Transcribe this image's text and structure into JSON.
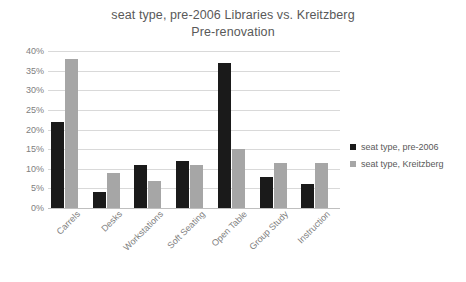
{
  "chart_data": {
    "type": "bar",
    "title": "seat type, pre-2006 Libraries vs. Kreitzberg Pre-renovation",
    "title_lines": [
      "seat type, pre-2006 Libraries vs. Kreitzberg",
      "Pre-renovation"
    ],
    "xlabel": "",
    "ylabel": "",
    "ylim": [
      0,
      40
    ],
    "ytick_step": 5,
    "ytick_labels": [
      "0%",
      "5%",
      "10%",
      "15%",
      "20%",
      "25%",
      "30%",
      "35%",
      "40%"
    ],
    "ytick_values": [
      0,
      5,
      10,
      15,
      20,
      25,
      30,
      35,
      40
    ],
    "grid": true,
    "legend_position": "right",
    "categories": [
      "Carrels",
      "Desks",
      "Workstations",
      "Soft Seating",
      "Open Table",
      "Group Study",
      "Instruction"
    ],
    "series": [
      {
        "name": "seat type, pre-2006",
        "color": "#1a1a1a",
        "values": [
          22,
          4,
          11,
          12,
          37,
          8,
          6
        ]
      },
      {
        "name": "seat type, Kreitzberg",
        "color": "#a6a6a6",
        "values": [
          38,
          9,
          7,
          11,
          15,
          11.5,
          11.5
        ]
      }
    ]
  },
  "colors": {
    "background": "#ffffff",
    "title_text": "#595959",
    "axis_text": "#808080",
    "gridline": "#d9d9d9",
    "baseline": "#bfbfbf",
    "series_0": "#1a1a1a",
    "series_1": "#a6a6a6"
  }
}
